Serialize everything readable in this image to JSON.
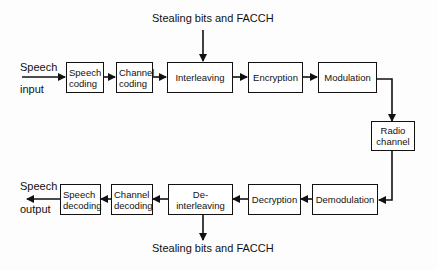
{
  "diagram": {
    "top_note": "Stealing bits and FACCH",
    "bottom_note": "Stealing bits and FACCH",
    "input_label_1": "Speech",
    "input_label_2": "input",
    "output_label_1": "Speech",
    "output_label_2": "output",
    "transmit_chain": [
      {
        "id": "speech-coding",
        "line1": "Speech",
        "line2": "coding"
      },
      {
        "id": "channel-coding",
        "line1": "Channel",
        "line2": "coding"
      },
      {
        "id": "interleaving",
        "line1": "Interleaving"
      },
      {
        "id": "encryption",
        "line1": "Encryption"
      },
      {
        "id": "modulation",
        "line1": "Modulation"
      }
    ],
    "channel": {
      "id": "radio-channel",
      "line1": "Radio",
      "line2": "channel"
    },
    "receive_chain": [
      {
        "id": "demodulation",
        "line1": "Demodulation"
      },
      {
        "id": "decryption",
        "line1": "Decryption"
      },
      {
        "id": "de-interleaving",
        "line1": "De-interleaving"
      },
      {
        "id": "channel-decoding",
        "line1": "Channel",
        "line2": "decoding"
      },
      {
        "id": "speech-decoding",
        "line1": "Speech",
        "line2": "decoding"
      }
    ],
    "colors": {
      "stroke": "#111111",
      "background": "#fdfdfd"
    }
  }
}
